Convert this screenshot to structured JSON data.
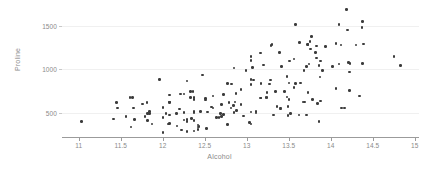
{
  "chart_data": {
    "type": "scatter",
    "title": "",
    "xlabel": "Alcohol",
    "ylabel": "Proline",
    "xlim": [
      10.8,
      15.05
    ],
    "ylim": [
      230,
      1700
    ],
    "grid": true,
    "legend": "none",
    "marker": {
      "color": "#3b3b3b",
      "size": 2.6,
      "shape": "circle"
    },
    "xticks": [
      11,
      11.5,
      12,
      12.5,
      13,
      13.5,
      14,
      14.5,
      15
    ],
    "xtick_labels": [
      "11",
      "11.5",
      "12",
      "12.5",
      "13",
      "13.5",
      "14",
      "14.5",
      "15"
    ],
    "yticks": [
      500,
      1000,
      1500
    ],
    "ytick_labels": [
      "500",
      "1000",
      "1500"
    ],
    "series_name": "wine samples",
    "points": [
      [
        14.23,
        1065
      ],
      [
        13.2,
        1050
      ],
      [
        13.16,
        1185
      ],
      [
        14.37,
        1480
      ],
      [
        13.24,
        735
      ],
      [
        14.2,
        1450
      ],
      [
        14.39,
        1290
      ],
      [
        14.06,
        1295
      ],
      [
        14.83,
        1045
      ],
      [
        13.86,
        1045
      ],
      [
        14.1,
        1510
      ],
      [
        14.12,
        1280
      ],
      [
        13.75,
        1320
      ],
      [
        14.75,
        1150
      ],
      [
        14.38,
        1547
      ],
      [
        13.63,
        1310
      ],
      [
        14.3,
        1280
      ],
      [
        13.83,
        1130
      ],
      [
        14.19,
        1680
      ],
      [
        13.64,
        845
      ],
      [
        14.06,
        780
      ],
      [
        12.93,
        770
      ],
      [
        13.71,
        1035
      ],
      [
        12.85,
        1015
      ],
      [
        13.5,
        845
      ],
      [
        13.05,
        830
      ],
      [
        13.39,
        1195
      ],
      [
        13.3,
        1285
      ],
      [
        13.87,
        915
      ],
      [
        14.02,
        1035
      ],
      [
        13.73,
        1285
      ],
      [
        13.58,
        1515
      ],
      [
        13.68,
        990
      ],
      [
        13.76,
        1235
      ],
      [
        13.51,
        1095
      ],
      [
        13.48,
        920
      ],
      [
        13.28,
        880
      ],
      [
        13.05,
        1105
      ],
      [
        13.07,
        1020
      ],
      [
        14.22,
        760
      ],
      [
        13.56,
        795
      ],
      [
        13.41,
        1035
      ],
      [
        13.88,
        1095
      ],
      [
        13.24,
        680
      ],
      [
        13.05,
        885
      ],
      [
        14.21,
        1080
      ],
      [
        14.38,
        1065
      ],
      [
        13.9,
        985
      ],
      [
        14.1,
        1060
      ],
      [
        13.94,
        1260
      ],
      [
        13.05,
        1150
      ],
      [
        13.83,
        1265
      ],
      [
        13.82,
        1190
      ],
      [
        13.77,
        1375
      ],
      [
        13.74,
        1060
      ],
      [
        13.56,
        1120
      ],
      [
        14.22,
        970
      ],
      [
        13.29,
        1270
      ],
      [
        13.72,
        1285
      ],
      [
        12.37,
        520
      ],
      [
        12.33,
        680
      ],
      [
        12.64,
        450
      ],
      [
        13.67,
        630
      ],
      [
        12.37,
        420
      ],
      [
        12.17,
        355
      ],
      [
        12.37,
        678
      ],
      [
        13.11,
        502
      ],
      [
        12.37,
        510
      ],
      [
        13.34,
        750
      ],
      [
        12.21,
        718
      ],
      [
        12.29,
        870
      ],
      [
        13.86,
        410
      ],
      [
        13.49,
        472
      ],
      [
        12.99,
        985
      ],
      [
        11.96,
        886
      ],
      [
        11.66,
        428
      ],
      [
        13.03,
        392
      ],
      [
        11.84,
        500
      ],
      [
        12.33,
        750
      ],
      [
        12.7,
        463
      ],
      [
        12.0,
        278
      ],
      [
        12.72,
        714
      ],
      [
        12.08,
        630
      ],
      [
        13.05,
        515
      ],
      [
        11.84,
        520
      ],
      [
        12.67,
        450
      ],
      [
        12.16,
        495
      ],
      [
        11.65,
        562
      ],
      [
        11.64,
        680
      ],
      [
        12.08,
        625
      ],
      [
        12.08,
        480
      ],
      [
        12.0,
        450
      ],
      [
        12.69,
        495
      ],
      [
        12.29,
        290
      ],
      [
        11.62,
        345
      ],
      [
        12.47,
        937
      ],
      [
        11.81,
        625
      ],
      [
        12.29,
        428
      ],
      [
        12.37,
        660
      ],
      [
        12.29,
        406
      ],
      [
        12.08,
        710
      ],
      [
        12.6,
        562
      ],
      [
        12.34,
        438
      ],
      [
        11.82,
        415
      ],
      [
        12.51,
        672
      ],
      [
        12.42,
        315
      ],
      [
        12.25,
        510
      ],
      [
        12.72,
        488
      ],
      [
        12.22,
        312
      ],
      [
        11.61,
        680
      ],
      [
        11.46,
        562
      ],
      [
        12.52,
        325
      ],
      [
        11.76,
        607
      ],
      [
        11.41,
        434
      ],
      [
        12.08,
        385
      ],
      [
        11.03,
        407
      ],
      [
        11.82,
        495
      ],
      [
        12.42,
        345
      ],
      [
        12.77,
        372
      ],
      [
        12.0,
        564
      ],
      [
        11.45,
        625
      ],
      [
        11.56,
        465
      ],
      [
        12.42,
        365
      ],
      [
        13.05,
        380
      ],
      [
        11.87,
        380
      ],
      [
        12.07,
        378
      ],
      [
        12.43,
        352
      ],
      [
        11.79,
        466
      ],
      [
        12.37,
        300
      ],
      [
        12.04,
        500
      ],
      [
        12.86,
        630
      ],
      [
        12.88,
        530
      ],
      [
        12.81,
        560
      ],
      [
        12.7,
        600
      ],
      [
        12.51,
        650
      ],
      [
        12.6,
        695
      ],
      [
        12.25,
        720
      ],
      [
        12.53,
        515
      ],
      [
        13.49,
        580
      ],
      [
        12.84,
        590
      ],
      [
        12.93,
        600
      ],
      [
        13.36,
        580
      ],
      [
        13.52,
        500
      ],
      [
        13.62,
        480
      ],
      [
        12.25,
        425
      ],
      [
        13.16,
        675
      ],
      [
        13.88,
        640
      ],
      [
        12.87,
        725
      ],
      [
        13.32,
        480
      ],
      [
        13.08,
        880
      ],
      [
        13.5,
        660
      ],
      [
        12.79,
        620
      ],
      [
        13.11,
        520
      ],
      [
        13.23,
        680
      ],
      [
        12.58,
        570
      ],
      [
        13.17,
        675
      ],
      [
        13.84,
        615
      ],
      [
        12.45,
        520
      ],
      [
        14.34,
        695
      ],
      [
        13.48,
        685
      ],
      [
        12.36,
        750
      ],
      [
        13.69,
        630
      ],
      [
        12.85,
        510
      ],
      [
        12.96,
        470
      ],
      [
        13.78,
        660
      ],
      [
        13.73,
        740
      ],
      [
        13.45,
        750
      ],
      [
        12.82,
        835
      ],
      [
        13.58,
        840
      ],
      [
        13.4,
        560
      ],
      [
        12.2,
        550
      ],
      [
        12.77,
        840
      ],
      [
        14.16,
        560
      ],
      [
        13.71,
        480
      ],
      [
        13.4,
        550
      ],
      [
        13.27,
        835
      ],
      [
        13.17,
        840
      ],
      [
        14.13,
        560
      ]
    ]
  },
  "axes": {
    "x_title": "Alcohol",
    "y_title": "Proline"
  }
}
